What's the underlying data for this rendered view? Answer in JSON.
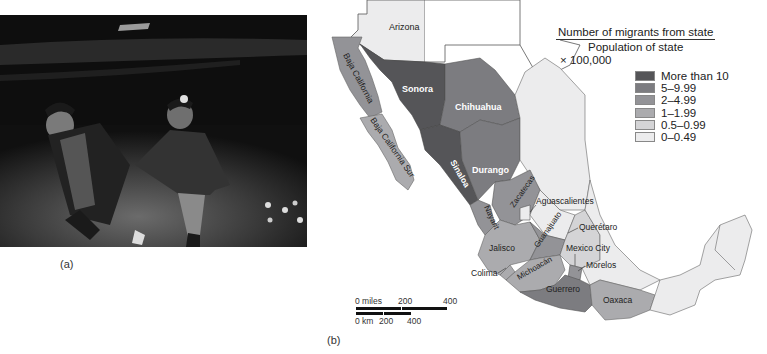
{
  "figure": {
    "photo_caption": "(a)",
    "map_caption": "(b)"
  },
  "formula": {
    "numerator": "Number of migrants from state",
    "denominator": "Population of state",
    "multiplier": "× 100,000"
  },
  "legend": {
    "items": [
      {
        "label": "More than 10",
        "color": "#555558"
      },
      {
        "label": "5–9.99",
        "color": "#7c7c80"
      },
      {
        "label": "2–4.99",
        "color": "#939397"
      },
      {
        "label": "1–1.99",
        "color": "#ababae"
      },
      {
        "label": "0.5–0.99",
        "color": "#d4d4d6"
      },
      {
        "label": "0–0.49",
        "color": "#ececed"
      }
    ]
  },
  "map_labels": {
    "arizona": "Arizona",
    "baja_california": "Baja California",
    "baja_california_sur": "Baja California Sur",
    "sonora": "Sonora",
    "chihuahua": "Chihuahua",
    "sinaloa": "Sinaloa",
    "durango": "Durango",
    "nayarit": "Nayarit",
    "zacatecas": "Zacatecas",
    "aguascalientes": "Aguascalientes",
    "guanajuato": "Guanajuato",
    "queretaro": "Querétaro",
    "jalisco": "Jalisco",
    "mexico_city": "Mexico City",
    "colima": "Colima",
    "michoacan": "Michoacán",
    "morelos": "Morelos",
    "guerrero": "Guerrero",
    "oaxaca": "Oaxaca"
  },
  "scale_bar": {
    "miles_label": "0 miles",
    "miles_200": "200",
    "miles_400": "400",
    "km_label": "0 km",
    "km_200": "200",
    "km_400": "400"
  }
}
